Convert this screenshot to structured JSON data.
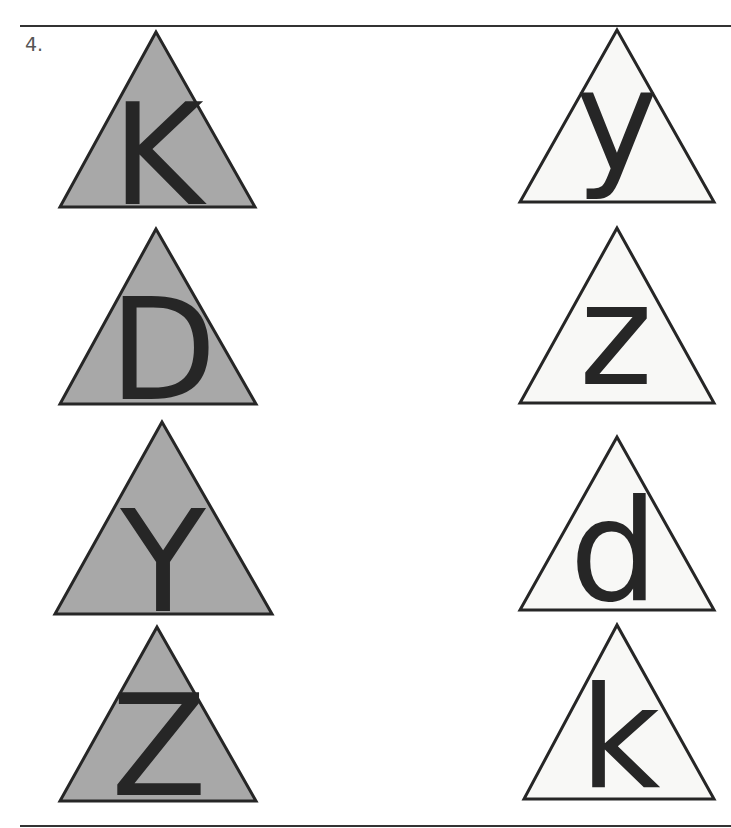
{
  "worksheet": {
    "item_number": "4.",
    "colors": {
      "shaded_fill": "#a8a8a8",
      "plain_fill": "#f8f8f6",
      "stroke": "#262626",
      "letter": "#262626"
    },
    "left_column": [
      {
        "letter": "K",
        "shaded": true
      },
      {
        "letter": "D",
        "shaded": true
      },
      {
        "letter": "Y",
        "shaded": true
      },
      {
        "letter": "Z",
        "shaded": true
      }
    ],
    "right_column": [
      {
        "letter": "y",
        "shaded": false
      },
      {
        "letter": "z",
        "shaded": false
      },
      {
        "letter": "d",
        "shaded": false
      },
      {
        "letter": "k",
        "shaded": false
      }
    ]
  }
}
